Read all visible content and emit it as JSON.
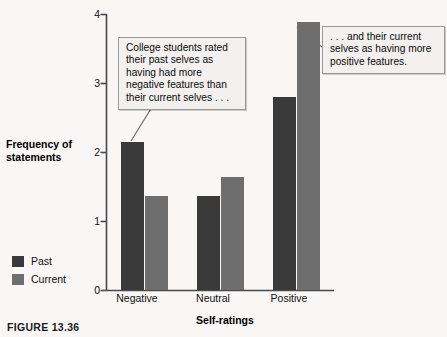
{
  "figure": {
    "caption": "FIGURE 13.36"
  },
  "chart_data": {
    "type": "bar",
    "title": "",
    "xlabel": "Self-ratings",
    "ylabel": "Frequency of statements",
    "categories": [
      "Negative",
      "Neutral",
      "Positive"
    ],
    "series": [
      {
        "name": "Past",
        "color": "#3a3a3a",
        "values": [
          2.15,
          1.36,
          2.8
        ]
      },
      {
        "name": "Current",
        "color": "#6e6e6e",
        "values": [
          1.36,
          1.64,
          3.88
        ]
      }
    ],
    "ylim": [
      0,
      4
    ],
    "yticks": [
      "0",
      "1",
      "2",
      "3",
      "4"
    ],
    "ytick_values": [
      0,
      1,
      2,
      3,
      4
    ],
    "grid": false,
    "legend_position": "left-bottom"
  },
  "annotations": [
    {
      "id": "callout-left",
      "text": "College students rated their past selves as having had more negative features than their current selves . . ."
    },
    {
      "id": "callout-right",
      "text": ". . . and their current selves as having more positive features."
    }
  ],
  "axes": {
    "y_title_line1": "Frequency of",
    "y_title_line2": "statements"
  }
}
